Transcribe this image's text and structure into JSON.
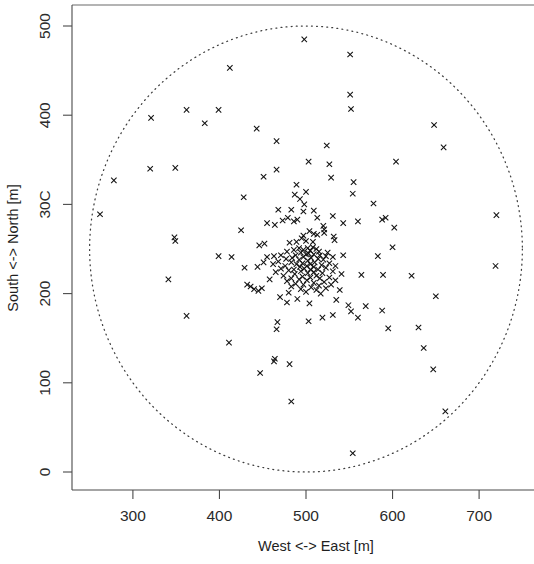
{
  "chart_data": {
    "type": "scatter",
    "title": "",
    "xlabel": "West <-> East [m]",
    "ylabel": "South <-> North [m]",
    "xlim": [
      243,
      765
    ],
    "ylim": [
      -18,
      520
    ],
    "xticks": [
      300,
      400,
      500,
      600,
      700
    ],
    "xtick_labels": [
      "300",
      "400",
      "500",
      "600",
      "700"
    ],
    "yticks": [
      0,
      100,
      200,
      300,
      400,
      500
    ],
    "ytick_labels": [
      "0",
      "100",
      "200",
      "30C",
      "400",
      "500"
    ],
    "grid": false,
    "legend": null,
    "marker_symbol": "x",
    "marker_color": "#111111",
    "annotations": [
      {
        "kind": "circle",
        "name": "coverage-boundary-circle",
        "center": [
          500,
          250
        ],
        "radius": 250,
        "style": "dotted"
      }
    ],
    "points": [
      [
        498,
        485
      ],
      [
        551,
        468
      ],
      [
        412,
        453
      ],
      [
        551,
        423
      ],
      [
        552,
        407
      ],
      [
        362,
        406
      ],
      [
        399,
        406
      ],
      [
        321,
        397
      ],
      [
        383,
        391
      ],
      [
        648,
        389
      ],
      [
        443,
        385
      ],
      [
        466,
        371
      ],
      [
        524,
        366
      ],
      [
        659,
        364
      ],
      [
        604,
        348
      ],
      [
        503,
        348
      ],
      [
        527,
        345
      ],
      [
        349,
        341
      ],
      [
        320,
        340
      ],
      [
        466,
        339
      ],
      [
        278,
        327
      ],
      [
        451,
        331
      ],
      [
        529,
        330
      ],
      [
        555,
        325
      ],
      [
        489,
        322
      ],
      [
        554,
        312
      ],
      [
        428,
        308
      ],
      [
        487,
        311
      ],
      [
        500,
        314
      ],
      [
        493,
        306
      ],
      [
        498,
        300
      ],
      [
        578,
        301
      ],
      [
        262,
        289
      ],
      [
        720,
        288
      ],
      [
        468,
        294
      ],
      [
        483,
        294
      ],
      [
        509,
        293
      ],
      [
        497,
        292
      ],
      [
        479,
        285
      ],
      [
        531,
        287
      ],
      [
        513,
        285
      ],
      [
        490,
        283
      ],
      [
        486,
        281
      ],
      [
        473,
        282
      ],
      [
        592,
        285
      ],
      [
        588,
        283
      ],
      [
        455,
        279
      ],
      [
        560,
        281
      ],
      [
        520,
        276
      ],
      [
        602,
        274
      ],
      [
        543,
        279
      ],
      [
        521,
        272
      ],
      [
        464,
        277
      ],
      [
        521,
        268
      ],
      [
        504,
        270
      ],
      [
        509,
        267
      ],
      [
        513,
        266
      ],
      [
        425,
        271
      ],
      [
        497,
        265
      ],
      [
        532,
        264
      ],
      [
        533,
        260
      ],
      [
        495,
        262
      ],
      [
        348,
        263
      ],
      [
        349,
        259
      ],
      [
        500,
        259
      ],
      [
        508,
        258
      ],
      [
        489,
        258
      ],
      [
        481,
        257
      ],
      [
        452,
        256
      ],
      [
        446,
        254
      ],
      [
        600,
        252
      ],
      [
        508,
        252
      ],
      [
        492,
        251
      ],
      [
        502,
        251
      ],
      [
        512,
        250
      ],
      [
        497,
        249
      ],
      [
        505,
        248
      ],
      [
        486,
        249
      ],
      [
        515,
        247
      ],
      [
        478,
        247
      ],
      [
        525,
        246
      ],
      [
        494,
        246
      ],
      [
        503,
        245
      ],
      [
        509,
        244
      ],
      [
        500,
        244
      ],
      [
        516,
        243
      ],
      [
        471,
        243
      ],
      [
        488,
        243
      ],
      [
        523,
        242
      ],
      [
        463,
        242
      ],
      [
        531,
        241
      ],
      [
        455,
        241
      ],
      [
        497,
        241
      ],
      [
        506,
        240
      ],
      [
        484,
        240
      ],
      [
        514,
        239
      ],
      [
        477,
        239
      ],
      [
        520,
        238
      ],
      [
        492,
        238
      ],
      [
        502,
        237
      ],
      [
        543,
        243
      ],
      [
        583,
        242
      ],
      [
        399,
        242
      ],
      [
        414,
        241
      ],
      [
        468,
        236
      ],
      [
        510,
        235
      ],
      [
        483,
        235
      ],
      [
        451,
        235
      ],
      [
        527,
        234
      ],
      [
        496,
        234
      ],
      [
        505,
        233
      ],
      [
        489,
        233
      ],
      [
        518,
        232
      ],
      [
        462,
        233
      ],
      [
        534,
        231
      ],
      [
        719,
        231
      ],
      [
        476,
        231
      ],
      [
        501,
        231
      ],
      [
        493,
        230
      ],
      [
        509,
        230
      ],
      [
        444,
        230
      ],
      [
        429,
        229
      ],
      [
        523,
        229
      ],
      [
        471,
        228
      ],
      [
        498,
        228
      ],
      [
        514,
        227
      ],
      [
        486,
        227
      ],
      [
        505,
        227
      ],
      [
        480,
        226
      ],
      [
        531,
        225
      ],
      [
        494,
        225
      ],
      [
        509,
        224
      ],
      [
        465,
        224
      ],
      [
        519,
        223
      ],
      [
        502,
        223
      ],
      [
        487,
        222
      ],
      [
        541,
        222
      ],
      [
        564,
        221
      ],
      [
        589,
        221
      ],
      [
        622,
        220
      ],
      [
        474,
        220
      ],
      [
        512,
        220
      ],
      [
        496,
        219
      ],
      [
        527,
        218
      ],
      [
        505,
        218
      ],
      [
        483,
        217
      ],
      [
        516,
        217
      ],
      [
        492,
        216
      ],
      [
        458,
        216
      ],
      [
        534,
        215
      ],
      [
        501,
        215
      ],
      [
        478,
        214
      ],
      [
        521,
        213
      ],
      [
        509,
        212
      ],
      [
        341,
        216
      ],
      [
        488,
        211
      ],
      [
        529,
        210
      ],
      [
        497,
        210
      ],
      [
        515,
        209
      ],
      [
        483,
        208
      ],
      [
        506,
        207
      ],
      [
        523,
        206
      ],
      [
        494,
        205
      ],
      [
        539,
        204
      ],
      [
        512,
        204
      ],
      [
        432,
        210
      ],
      [
        436,
        208
      ],
      [
        440,
        205
      ],
      [
        445,
        203
      ],
      [
        449,
        206
      ],
      [
        650,
        197
      ],
      [
        500,
        202
      ],
      [
        480,
        201
      ],
      [
        517,
        200
      ],
      [
        470,
        196
      ],
      [
        490,
        194
      ],
      [
        535,
        193
      ],
      [
        478,
        190
      ],
      [
        504,
        189
      ],
      [
        549,
        187
      ],
      [
        569,
        186
      ],
      [
        552,
        180
      ],
      [
        588,
        181
      ],
      [
        362,
        175
      ],
      [
        531,
        176
      ],
      [
        519,
        173
      ],
      [
        560,
        173
      ],
      [
        503,
        169
      ],
      [
        467,
        168
      ],
      [
        630,
        162
      ],
      [
        595,
        161
      ],
      [
        466,
        160
      ],
      [
        411,
        145
      ],
      [
        636,
        139
      ],
      [
        481,
        121
      ],
      [
        464,
        127
      ],
      [
        463,
        124
      ],
      [
        447,
        111
      ],
      [
        647,
        115
      ],
      [
        483,
        79
      ],
      [
        661,
        68
      ],
      [
        554,
        21
      ]
    ]
  },
  "axes": {
    "x_axis_name": "x-axis",
    "y_axis_name": "y-axis"
  }
}
